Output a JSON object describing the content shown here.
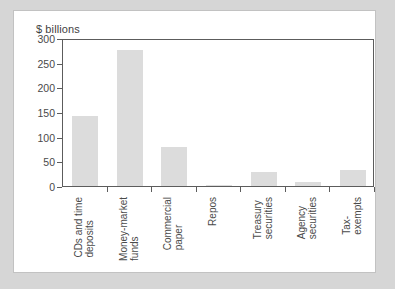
{
  "figure": {
    "title": "$ billions",
    "background_color": "#ffffff",
    "page_background_color": "#d6d6d6",
    "bar_color": "#dcdcdc",
    "axis_color": "#5c5c5c",
    "text_color": "#4a4a4a"
  },
  "chart_data": {
    "type": "bar",
    "title": "$ billions",
    "xlabel": "",
    "ylabel": "$ billions",
    "ylim": [
      0,
      300
    ],
    "yticks": [
      0,
      50,
      100,
      150,
      200,
      250,
      300
    ],
    "ytick_labels": [
      "0",
      "50",
      "100",
      "150",
      "200",
      "250",
      "300"
    ],
    "grid": false,
    "legend": "none",
    "categories": [
      "CDs and time deposits",
      "Money-market funds",
      "Commercial paper",
      "Repos",
      "Treasury securities",
      "Agency securities",
      "Tax-exempts"
    ],
    "category_lines": [
      [
        "CDs and time",
        "deposits"
      ],
      [
        "Money-market",
        "funds"
      ],
      [
        "Commercial",
        "paper"
      ],
      [
        "Repos"
      ],
      [
        "Treasury",
        "securities"
      ],
      [
        "Agency",
        "securities"
      ],
      [
        "Tax-",
        "exempts"
      ]
    ],
    "values": [
      141,
      275,
      80,
      3,
      29,
      8,
      33
    ]
  }
}
